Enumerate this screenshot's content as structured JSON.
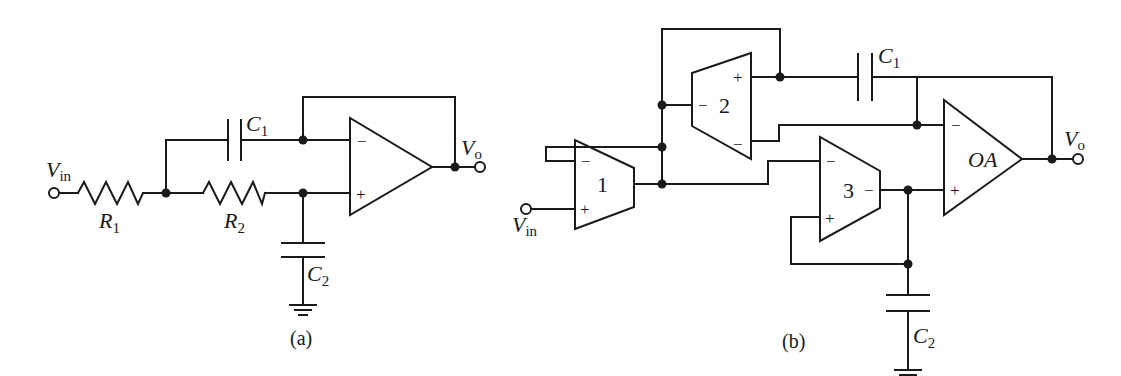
{
  "figure": {
    "panels": [
      {
        "id": "a",
        "caption": "(a)",
        "input_label": {
          "main": "V",
          "sub": "in"
        },
        "output_label": {
          "main": "V",
          "sub": "o"
        },
        "components": {
          "R1": {
            "main": "R",
            "sub": "1"
          },
          "R2": {
            "main": "R",
            "sub": "2"
          },
          "C1": {
            "main": "C",
            "sub": "1"
          },
          "C2": {
            "main": "C",
            "sub": "2"
          }
        },
        "opamp": {
          "minus": "−",
          "plus": "+"
        }
      },
      {
        "id": "b",
        "caption": "(b)",
        "input_label": {
          "main": "V",
          "sub": "in"
        },
        "output_label": {
          "main": "V",
          "sub": "o"
        },
        "components": {
          "C1": {
            "main": "C",
            "sub": "1"
          },
          "C2": {
            "main": "C",
            "sub": "2"
          }
        },
        "blocks": [
          {
            "label": "1",
            "inputs": [
              "−",
              "+"
            ]
          },
          {
            "label": "2",
            "inputs": [
              "−"
            ],
            "outputs": [
              "+",
              "−"
            ]
          },
          {
            "label": "3",
            "inputs": [
              "−",
              "+"
            ],
            "outputs": [
              "−"
            ]
          },
          {
            "label": "OA",
            "inputs": [
              "−",
              "+"
            ]
          }
        ]
      }
    ]
  }
}
